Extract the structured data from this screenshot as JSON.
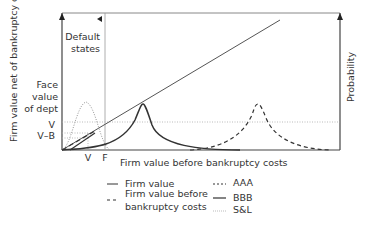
{
  "diagram": {
    "left_axis_label": "Firm value net of bankruptcy costs",
    "right_axis_label": "Probability",
    "x_axis_label": "Firm value before bankruptcy costs",
    "default_states_label_line1": "Default",
    "default_states_label_line2": "states",
    "face_value_line1": "Face",
    "face_value_line2": "value",
    "face_value_line3": "of dept",
    "y_tick_v": "V",
    "y_tick_vb": "V–B",
    "x_tick_v": "V",
    "x_tick_f": "F"
  },
  "legend": {
    "items": [
      {
        "label": "Firm value",
        "style": "solid"
      },
      {
        "label": "Firm value before",
        "label2": "bankruptcy costs",
        "style": "dashed"
      },
      {
        "label": "AAA",
        "style": "dashed-curve"
      },
      {
        "label": "BBB",
        "style": "solid-curve"
      },
      {
        "label": "S&L",
        "style": "dotted-curve"
      }
    ]
  },
  "colors": {
    "axis": "#444444",
    "curve": "#333333",
    "dotted": "#999999"
  }
}
